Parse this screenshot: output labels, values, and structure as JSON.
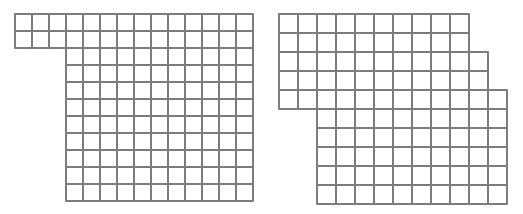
{
  "figures": [
    {
      "id": "left-grid",
      "origin": [
        14,
        13
      ],
      "cell_w": 17,
      "cell_h": 17,
      "rows": [
        {
          "start_col": 0,
          "count": 14
        },
        {
          "start_col": 0,
          "count": 14
        },
        {
          "start_col": 3,
          "count": 11
        },
        {
          "start_col": 3,
          "count": 11
        },
        {
          "start_col": 3,
          "count": 11
        },
        {
          "start_col": 3,
          "count": 11
        },
        {
          "start_col": 3,
          "count": 11
        },
        {
          "start_col": 3,
          "count": 11
        },
        {
          "start_col": 3,
          "count": 11
        },
        {
          "start_col": 3,
          "count": 11
        },
        {
          "start_col": 3,
          "count": 11
        }
      ],
      "line_color": "#7d7d7d"
    },
    {
      "id": "right-grid",
      "origin": [
        278,
        13
      ],
      "cell_w": 19,
      "cell_h": 19,
      "rows": [
        {
          "start_col": 0,
          "count": 10
        },
        {
          "start_col": 0,
          "count": 10
        },
        {
          "start_col": 0,
          "count": 11
        },
        {
          "start_col": 0,
          "count": 11
        },
        {
          "start_col": 0,
          "count": 12
        },
        {
          "start_col": 2,
          "count": 10
        },
        {
          "start_col": 2,
          "count": 10
        },
        {
          "start_col": 2,
          "count": 10
        },
        {
          "start_col": 2,
          "count": 10
        },
        {
          "start_col": 2,
          "count": 10
        }
      ],
      "line_color": "#7d7d7d"
    }
  ]
}
